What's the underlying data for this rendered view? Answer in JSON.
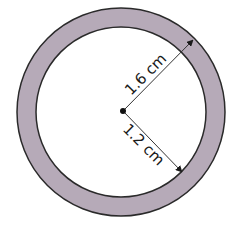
{
  "diagram": {
    "title": "",
    "shape": "annulus",
    "colors": {
      "ring_fill": "#b6aab8",
      "stroke": "#2a2a2a",
      "inner_fill": "#ffffff"
    },
    "outer_radius_label": "1.6 cm",
    "inner_radius_label": "1.2 cm",
    "outer_radius_value": 1.6,
    "inner_radius_value": 1.2,
    "unit": "cm"
  }
}
